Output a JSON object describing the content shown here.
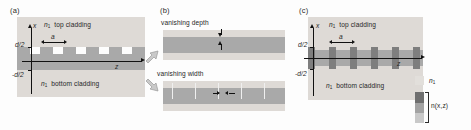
{
  "figure": {
    "panels": [
      {
        "id": "a",
        "label": "(a)",
        "name": "surface-relief-grating",
        "texts": {
          "top_cladding": "top cladding",
          "bottom_cladding": "bottom cladding",
          "cladding_index": "n",
          "cladding_index_sub": "1",
          "axis_x": "x",
          "axis_z": "z",
          "tick_upper": "d/2",
          "tick_lower": "-d/2",
          "period": "a"
        }
      },
      {
        "id": "b",
        "label": "(b)",
        "name": "limiting-cases",
        "texts": {
          "vanishing_depth": "vanishing depth",
          "vanishing_width": "vanishing width"
        }
      },
      {
        "id": "c",
        "label": "(c)",
        "name": "index-modulated-grating",
        "texts": {
          "top_cladding": "top cladding",
          "bottom_cladding": "bottom cladding",
          "cladding_index": "n",
          "cladding_index_sub": "1",
          "axis_x": "x",
          "axis_z": "z",
          "tick_upper": "d/2",
          "tick_lower": "-d/2",
          "period": "a"
        }
      }
    ],
    "legend": {
      "name": "index-legend",
      "entries": [
        {
          "label": "n",
          "label_sub": "1",
          "swatch": "cladding-light",
          "color": "#dedad6"
        },
        {
          "label": "n(x,z)",
          "label_sub": "",
          "swatch": "index-gradient",
          "color": "#7e7e7e"
        }
      ]
    },
    "colors": {
      "cladding": "#dedad6",
      "core": "#a9a9a9",
      "modulation": "#7e7e7e",
      "gradient_dark": "#6f6f6f",
      "gradient_mid": "#9b9b9b",
      "gradient_light": "#c4c4c4",
      "ink": "#111111",
      "background": "#fdfdfd"
    }
  }
}
